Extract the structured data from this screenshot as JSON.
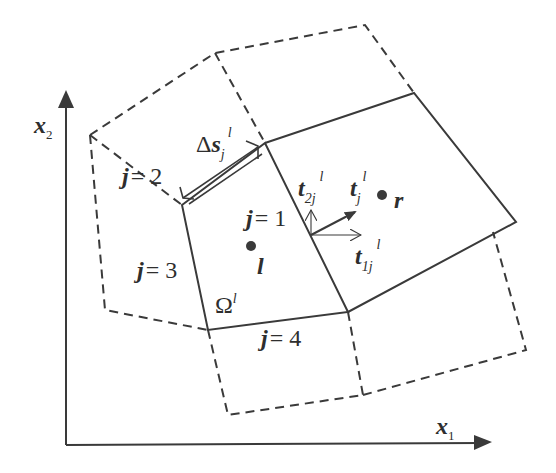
{
  "figure": {
    "colors": {
      "line": "#3a3a3a",
      "text": "#2e2e2e",
      "background": "#ffffff"
    }
  },
  "axes": {
    "x_label": "x",
    "x_sub": "1",
    "y_label": "x",
    "y_sub": "2"
  },
  "cell": {
    "omega": "Ω",
    "omega_sup": "l",
    "center_left": "l",
    "center_right": "r"
  },
  "edges": [
    {
      "j": "j",
      "eq": "= 1"
    },
    {
      "j": "j",
      "eq": "= 2"
    },
    {
      "j": "j",
      "eq": "= 3"
    },
    {
      "j": "j",
      "eq": "= 4"
    }
  ],
  "edge_length": {
    "delta": "Δ",
    "s": "s",
    "sub": "j",
    "sup": "l"
  },
  "vectors": {
    "t": {
      "base": "t",
      "sub": "j",
      "sup": "l"
    },
    "t1": {
      "base": "t",
      "sub": "1j",
      "sup": "l"
    },
    "t2": {
      "base": "t",
      "sub": "2j",
      "sup": "l"
    }
  }
}
